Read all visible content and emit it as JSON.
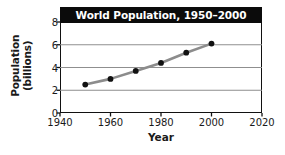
{
  "chart_data": {
    "type": "line",
    "title": "World Population, 1950–2000",
    "xlabel": "Year",
    "ylabel": "Population (billions)",
    "ylabel_line1": "Population",
    "ylabel_line2": "(billions)",
    "x": [
      1950,
      1960,
      1970,
      1980,
      1990,
      2000
    ],
    "values": [
      2.5,
      3.0,
      3.7,
      4.4,
      5.3,
      6.1
    ],
    "series": [
      {
        "name": "World Population",
        "values": [
          2.5,
          3.0,
          3.7,
          4.4,
          5.3,
          6.1
        ]
      }
    ],
    "xlim": [
      1940,
      2020
    ],
    "ylim": [
      0,
      8
    ],
    "xticks": [
      1940,
      1960,
      1980,
      2000,
      2020
    ],
    "yticks": [
      0,
      2,
      4,
      6,
      8
    ],
    "xtick_labels": [
      "1940",
      "1960",
      "1980",
      "2000",
      "2020"
    ],
    "ytick_labels": [
      "0",
      "2",
      "4",
      "6",
      "8"
    ],
    "grid": "horizontal",
    "legend": "none",
    "line_color": "#8c8c8c",
    "marker_color": "#111111",
    "grid_color": "#8f8f8f",
    "axis_color": "#111111",
    "title_bg_color": "#0b0b0b",
    "title_text_color": "#ffffff",
    "background_color": "#ffffff"
  }
}
